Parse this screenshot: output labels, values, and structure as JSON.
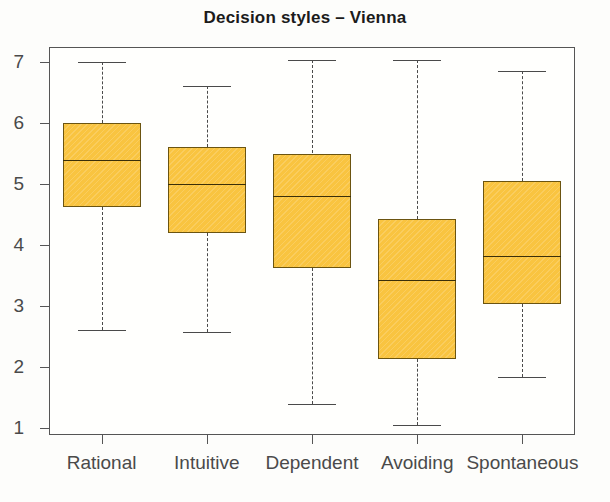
{
  "chart_data": {
    "type": "box",
    "title": "Decision styles – Vienna",
    "xlabel": "",
    "ylabel": "",
    "ylim": [
      1,
      7
    ],
    "yticks": [
      1,
      2,
      3,
      4,
      5,
      6,
      7
    ],
    "ytick_labels": [
      "1",
      "2",
      "3",
      "4",
      "5",
      "6",
      "7"
    ],
    "grid": false,
    "legend": null,
    "categories": [
      "Rational",
      "Intuitive",
      "Dependent",
      "Avoiding",
      "Spontaneous"
    ],
    "boxes": [
      {
        "label": "Rational",
        "whisker_low": 2.6,
        "q1": 4.63,
        "median": 5.4,
        "q3": 6.0,
        "whisker_high": 7.0
      },
      {
        "label": "Intuitive",
        "whisker_low": 2.58,
        "q1": 4.2,
        "median": 5.0,
        "q3": 5.6,
        "whisker_high": 6.6
      },
      {
        "label": "Dependent",
        "whisker_low": 1.4,
        "q1": 3.62,
        "median": 4.8,
        "q3": 5.5,
        "whisker_high": 7.03
      },
      {
        "label": "Avoiding",
        "whisker_low": 1.05,
        "q1": 2.13,
        "median": 3.43,
        "q3": 4.43,
        "whisker_high": 7.03
      },
      {
        "label": "Spontaneous",
        "whisker_low": 1.83,
        "q1": 3.03,
        "median": 3.82,
        "q3": 5.05,
        "whisker_high": 6.85
      }
    ],
    "style": {
      "box_fill": "#f9c440",
      "box_edge": "#6b5410",
      "median_color": "#3a2f08",
      "whisker_color": "#4a4a4a",
      "axis_color": "#555555",
      "background": "#fdfdfb"
    }
  }
}
